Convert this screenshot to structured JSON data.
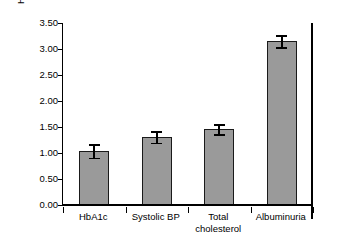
{
  "chart_data": {
    "type": "bar",
    "title": "",
    "xlabel": "",
    "ylabel": "Hazard ratio end-stage renal disease",
    "categories": [
      "HbA1c",
      "Systolic BP",
      "Total cholesterol",
      "Albuminuria"
    ],
    "category_lines": [
      [
        "HbA1c"
      ],
      [
        "Systolic BP"
      ],
      [
        "Total",
        "cholesterol"
      ],
      [
        "Albuminuria"
      ]
    ],
    "values": [
      1.04,
      1.31,
      1.46,
      3.15
    ],
    "error_low": [
      0.13,
      0.11,
      0.1,
      0.11
    ],
    "error_high": [
      0.13,
      0.11,
      0.1,
      0.11
    ],
    "ylim": [
      0.0,
      3.5
    ],
    "ytick_values": [
      0.0,
      0.5,
      1.0,
      1.5,
      2.0,
      2.5,
      3.0,
      3.5
    ],
    "ytick_labels": [
      "0.00",
      "0.50",
      "1.00",
      "1.50",
      "2.00",
      "2.50",
      "3.00",
      "3.50"
    ],
    "grid": false,
    "legend": false,
    "legend_position": "none",
    "bar_fill_color": "#9a9a9a",
    "bar_edge_color": "#1a1a1a",
    "axis_color": "#000000",
    "background_color": "#ffffff"
  }
}
